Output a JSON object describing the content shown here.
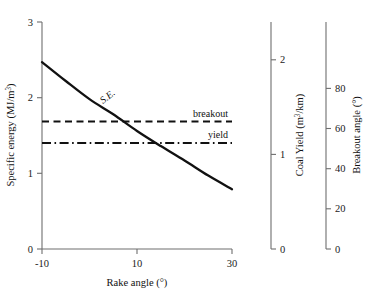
{
  "chart_data": {
    "type": "line",
    "title": "",
    "xlabel": "Rake angle (°)",
    "xlim": [
      -10,
      30
    ],
    "xticks": [
      -10,
      10,
      30
    ],
    "xtick_labels": [
      "-10",
      "10",
      "30"
    ],
    "grid": false,
    "legend_position": "inline-right",
    "axes": [
      {
        "id": "left",
        "label_prefix": "Specific energy (MJ/m",
        "label_superscript": "3",
        "label_suffix": ")",
        "label_text": "Specific energy (MJ/m3)",
        "units": "MJ/m³",
        "lim": [
          0,
          3
        ],
        "ticks": [
          0,
          1,
          2,
          3
        ],
        "tick_labels": [
          "0",
          "1",
          "2",
          "3"
        ]
      },
      {
        "id": "middle",
        "label_prefix": "Coal Yield (m",
        "label_superscript": "3",
        "label_suffix": "/km)",
        "label_text": "Coal Yield (m3/km)",
        "units": "m³/km",
        "lim": [
          0,
          2.4
        ],
        "ticks": [
          0,
          1,
          2
        ],
        "tick_labels": [
          "0",
          "1",
          "2"
        ]
      },
      {
        "id": "right",
        "label_prefix": "Breakout angle (°)",
        "label_superscript": "",
        "label_suffix": "",
        "label_text": "Breakout angle (°)",
        "units": "°",
        "lim": [
          0,
          113
        ],
        "ticks": [
          0,
          20,
          40,
          60,
          80
        ],
        "tick_labels": [
          "0",
          "20",
          "40",
          "60",
          "80"
        ]
      }
    ],
    "series": [
      {
        "name": "S.E.",
        "label": "S.E.",
        "axis": "left",
        "style": "solid",
        "label_rotation": -38,
        "x": [
          -10,
          -5,
          0,
          5,
          10,
          15,
          20,
          25,
          30
        ],
        "values": [
          2.47,
          2.22,
          1.98,
          1.78,
          1.56,
          1.36,
          1.17,
          0.97,
          0.79
        ]
      },
      {
        "name": "breakout",
        "label": "breakout",
        "axis": "right",
        "style": "dashed",
        "x": [
          -10,
          30
        ],
        "values": [
          63.5,
          63.5
        ],
        "left_axis_equivalent": 1.69
      },
      {
        "name": "yield",
        "label": "yield",
        "axis": "middle",
        "style": "dash-dot",
        "x": [
          -10,
          30
        ],
        "values": [
          1.12,
          1.12
        ],
        "left_axis_equivalent": 1.4
      }
    ],
    "colors": {
      "series": "#111111",
      "axis": "#6e6e6e",
      "background": "#ffffff"
    }
  }
}
